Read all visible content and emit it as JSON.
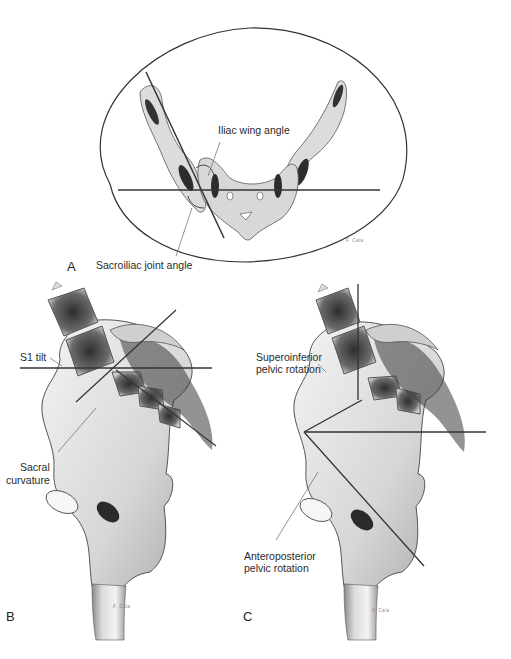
{
  "figure": {
    "panels": [
      {
        "id": "A",
        "letter": "A",
        "view": "axial",
        "labels": {
          "iliac_wing_angle": "Iliac wing angle",
          "sacroiliac_joint_angle": "Sacroiliac joint angle"
        },
        "signature": "F. Cala"
      },
      {
        "id": "B",
        "letter": "B",
        "view": "lateral",
        "labels": {
          "s1_tilt": "S1 tilt",
          "sacral_curvature_line1": "Sacral",
          "sacral_curvature_line2": "curvature"
        },
        "signature": "F. Cala"
      },
      {
        "id": "C",
        "letter": "C",
        "view": "lateral",
        "labels": {
          "superoinferior_line1": "Superoinferior",
          "superoinferior_line2": "pelvic rotation",
          "anteroposterior_line1": "Anteroposterior",
          "anteroposterior_line2": "pelvic rotation"
        },
        "signature": "F. Cala"
      }
    ],
    "colors": {
      "background": "#ffffff",
      "line": "#3a3a3a",
      "bone_fill": "#e4e4e4",
      "marrow": "#3c3c3c",
      "text": "#2a2a2a"
    }
  }
}
